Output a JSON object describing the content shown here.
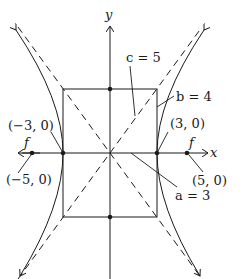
{
  "diagram": {
    "type": "hyperbola",
    "axes": {
      "x_label": "x",
      "y_label": "y"
    },
    "labels": {
      "c": "c = 5",
      "b": "b = 4",
      "a": "a = 3",
      "left_vertex": "(−3, 0)",
      "right_vertex": "(3, 0)",
      "left_focus": "(−5, 0)",
      "right_focus": "(5, 0)",
      "focus_left_marker": "f",
      "focus_right_marker": "f"
    },
    "parameters": {
      "a": 3,
      "b": 4,
      "c": 5
    },
    "points": [
      {
        "name": "left-vertex",
        "x": -3,
        "y": 0
      },
      {
        "name": "right-vertex",
        "x": 3,
        "y": 0
      },
      {
        "name": "left-focus",
        "x": -5,
        "y": 0
      },
      {
        "name": "right-focus",
        "x": 5,
        "y": 0
      },
      {
        "name": "top-co-vertex",
        "x": 0,
        "y": 4
      },
      {
        "name": "bottom-co-vertex",
        "x": 0,
        "y": -4
      }
    ],
    "colors": {
      "stroke": "#1a1a1a",
      "background": "#ffffff"
    }
  }
}
